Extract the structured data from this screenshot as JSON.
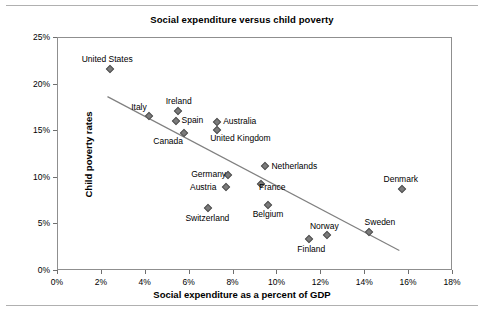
{
  "chart_data": {
    "type": "scatter",
    "title": "Social expenditure versus child poverty",
    "xlabel": "Social expenditure as a percent of GDP",
    "ylabel": "Child poverty rates",
    "xlim": [
      0,
      18
    ],
    "ylim": [
      0,
      25
    ],
    "xticks": [
      "0%",
      "2%",
      "4%",
      "6%",
      "8%",
      "10%",
      "12%",
      "14%",
      "16%",
      "18%"
    ],
    "xtick_values": [
      0,
      2,
      4,
      6,
      8,
      10,
      12,
      14,
      16,
      18
    ],
    "yticks": [
      "0%",
      "5%",
      "10%",
      "15%",
      "20%",
      "25%"
    ],
    "ytick_values": [
      0,
      5,
      10,
      15,
      20,
      25
    ],
    "grid": false,
    "legend": "none",
    "marker": "diamond",
    "marker_color": "#7b7b7b",
    "trendline": {
      "show": true,
      "color": "#808080",
      "x_start": 2.3,
      "y_start": 18.6,
      "x_end": 15.6,
      "y_end": 2.1
    },
    "points": [
      {
        "label": "United States",
        "x": 2.4,
        "y": 21.6,
        "label_dx": -28,
        "label_dy": -14
      },
      {
        "label": "Italy",
        "x": 4.2,
        "y": 16.5,
        "label_dx": -18,
        "label_dy": -13
      },
      {
        "label": "Ireland",
        "x": 5.5,
        "y": 17.1,
        "label_dx": -12,
        "label_dy": -14
      },
      {
        "label": "Spain",
        "x": 5.4,
        "y": 16.0,
        "label_dx": 6,
        "label_dy": -5
      },
      {
        "label": "Canada",
        "x": 5.8,
        "y": 14.7,
        "label_dx": -31,
        "label_dy": 4
      },
      {
        "label": "Australia",
        "x": 7.3,
        "y": 15.9,
        "label_dx": 6,
        "label_dy": -5
      },
      {
        "label": "United Kingdom",
        "x": 7.3,
        "y": 15.0,
        "label_dx": -7,
        "label_dy": 4
      },
      {
        "label": "Germany",
        "x": 7.8,
        "y": 10.2,
        "label_dx": -37,
        "label_dy": -5
      },
      {
        "label": "Netherlands",
        "x": 9.5,
        "y": 11.2,
        "label_dx": 6,
        "label_dy": -4
      },
      {
        "label": "France",
        "x": 9.3,
        "y": 9.2,
        "label_dx": -2,
        "label_dy": -1
      },
      {
        "label": "Austria",
        "x": 7.7,
        "y": 8.9,
        "label_dx": -36,
        "label_dy": -4
      },
      {
        "label": "Belgium",
        "x": 9.6,
        "y": 7.0,
        "label_dx": -15,
        "label_dy": 5
      },
      {
        "label": "Switzerland",
        "x": 6.9,
        "y": 6.7,
        "label_dx": -23,
        "label_dy": 6
      },
      {
        "label": "Norway",
        "x": 12.3,
        "y": 3.8,
        "label_dx": -17,
        "label_dy": -13
      },
      {
        "label": "Finland",
        "x": 11.5,
        "y": 3.3,
        "label_dx": -12,
        "label_dy": 6
      },
      {
        "label": "Sweden",
        "x": 14.2,
        "y": 4.1,
        "label_dx": -4,
        "label_dy": -14
      },
      {
        "label": "Denmark",
        "x": 15.7,
        "y": 8.7,
        "label_dx": -18,
        "label_dy": -14
      }
    ]
  }
}
